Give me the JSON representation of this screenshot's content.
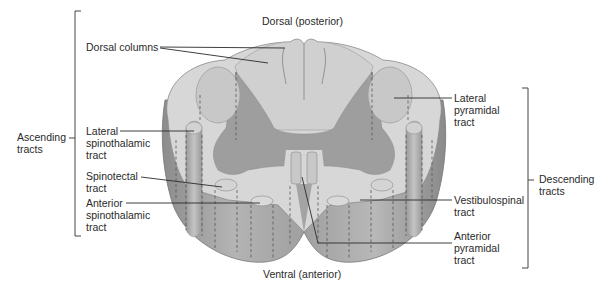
{
  "orientation": {
    "top": "Dorsal (posterior)",
    "bottom": "Ventral (anterior)"
  },
  "groups": {
    "ascending": {
      "line1": "Ascending",
      "line2": "tracts"
    },
    "descending": {
      "line1": "Descending",
      "line2": "tracts"
    }
  },
  "labels": {
    "dorsal_columns": {
      "line1": "Dorsal columns"
    },
    "lateral_spinothalamic": {
      "line1": "Lateral",
      "line2": "spinothalamic",
      "line3": "tract"
    },
    "spinotectal": {
      "line1": "Spinotectal",
      "line2": "tract"
    },
    "anterior_spinothalamic": {
      "line1": "Anterior",
      "line2": "spinothalamic",
      "line3": "tract"
    },
    "lateral_pyramidal": {
      "line1": "Lateral",
      "line2": "pyramidal",
      "line3": "tract"
    },
    "vestibulospinal": {
      "line1": "Vestibulospinal",
      "line2": "tract"
    },
    "anterior_pyramidal": {
      "line1": "Anterior",
      "line2": "pyramidal",
      "line3": "tract"
    }
  },
  "colors": {
    "white_matter": "#d6d6d6",
    "gray_matter": "#9c9c9c",
    "column_side": "#a8a8a8",
    "column_shadow": "#8e8e8e",
    "outline": "#6a6a6a",
    "leader": "#2a2a2a"
  }
}
